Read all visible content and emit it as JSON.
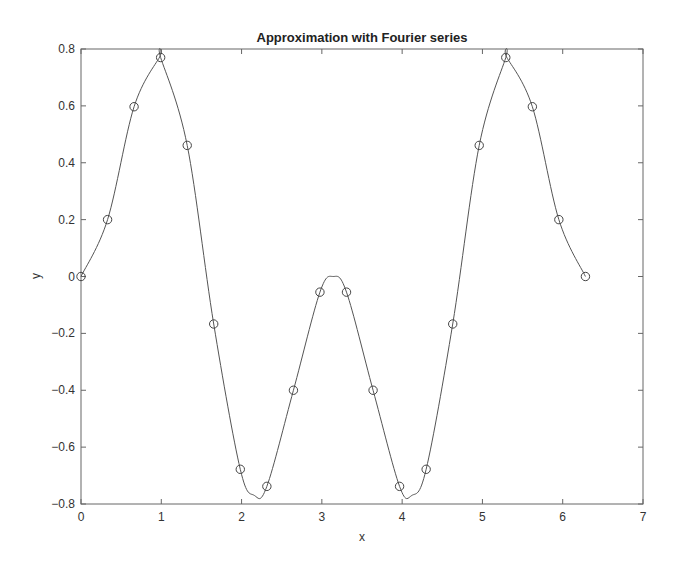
{
  "chart_data": {
    "type": "line",
    "title": "Approximation with Fourier series",
    "xlabel": "x",
    "ylabel": "y",
    "xlim": [
      0,
      7
    ],
    "ylim": [
      -0.8,
      0.8
    ],
    "xticks": [
      0,
      1,
      2,
      3,
      4,
      5,
      6,
      7
    ],
    "yticks": [
      -0.8,
      -0.6,
      -0.4,
      -0.2,
      0,
      0.2,
      0.4,
      0.6,
      0.8
    ],
    "xtick_labels": [
      "0",
      "1",
      "2",
      "3",
      "4",
      "5",
      "6",
      "7"
    ],
    "ytick_labels": [
      "-0.8",
      "-0.6",
      "-0.4",
      "-0.2",
      "0",
      "0.2",
      "0.4",
      "0.6",
      "0.8"
    ],
    "grid": false,
    "legend": null,
    "series": [
      {
        "name": "samples",
        "style": "markers",
        "marker": "open-circle",
        "x": [
          0,
          0.331,
          0.661,
          0.992,
          1.323,
          1.653,
          1.984,
          2.315,
          2.646,
          2.976,
          3.307,
          3.638,
          3.968,
          4.299,
          4.63,
          4.96,
          5.291,
          5.622,
          5.952,
          6.283
        ],
        "y": [
          0,
          0.2,
          0.597,
          0.77,
          0.461,
          -0.167,
          -0.678,
          -0.738,
          -0.4,
          -0.055,
          -0.055,
          -0.4,
          -0.738,
          -0.678,
          -0.167,
          0.461,
          0.77,
          0.597,
          0.2,
          0
        ]
      },
      {
        "name": "Fourier approximation",
        "style": "line",
        "x": [
          0,
          0.331,
          0.661,
          0.98,
          0.992,
          1.323,
          1.653,
          1.984,
          2.16,
          2.315,
          2.646,
          2.976,
          3.1416,
          3.307,
          3.638,
          3.968,
          4.12,
          4.299,
          4.63,
          4.96,
          5.291,
          5.3,
          5.622,
          5.952,
          6.283
        ],
        "y": [
          0,
          0.2,
          0.597,
          0.772,
          0.77,
          0.461,
          -0.167,
          -0.678,
          -0.77,
          -0.738,
          -0.4,
          -0.055,
          0.0,
          -0.055,
          -0.4,
          -0.738,
          -0.77,
          -0.678,
          -0.167,
          0.461,
          0.77,
          0.772,
          0.597,
          0.2,
          0
        ]
      }
    ],
    "colors": {
      "line": "#555555",
      "marker": "#444444",
      "axis": "#666666"
    }
  }
}
